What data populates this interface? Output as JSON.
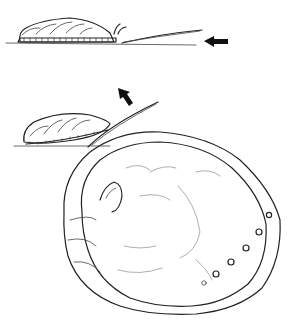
{
  "figure": {
    "panels": [
      {
        "id": "abalone-on-rock",
        "arrow_direction": "left"
      },
      {
        "id": "abalone-being-pried",
        "arrow_direction": "up-left"
      },
      {
        "id": "abalone-shell-interior",
        "respiratory_pores": 6
      }
    ],
    "colors": {
      "ink": "#222222",
      "background": "#ffffff"
    }
  }
}
